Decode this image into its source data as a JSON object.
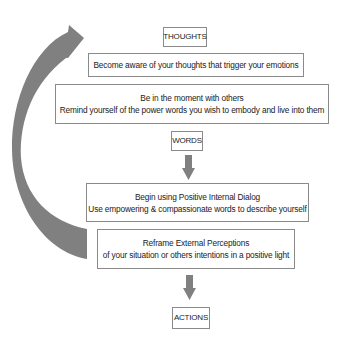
{
  "diagram": {
    "colors": {
      "arrow": "#808080",
      "box_border": "#8a8a8a",
      "text": "#222222",
      "background": "#ffffff"
    },
    "stages": {
      "thoughts": "THOUGHTS",
      "words": "WORDS",
      "actions": "ACTIONS"
    },
    "steps": [
      {
        "lines": [
          "Become aware of your thoughts that trigger your emotions"
        ]
      },
      {
        "lines": [
          "Be in the moment with others",
          "Remind yourself of the power words you wish to embody  and live into them"
        ]
      },
      {
        "lines": [
          "Begin using Positive Internal Dialog",
          "Use empowering & compassionate words to describe yourself"
        ]
      },
      {
        "lines": [
          "Reframe External Perceptions",
          "of your situation  or others intentions in a positive light"
        ]
      }
    ],
    "icons": {
      "cycle_arrow": "curved-arrow-icon",
      "down_arrow_1": "down-arrow-icon",
      "down_arrow_2": "down-arrow-icon"
    }
  }
}
